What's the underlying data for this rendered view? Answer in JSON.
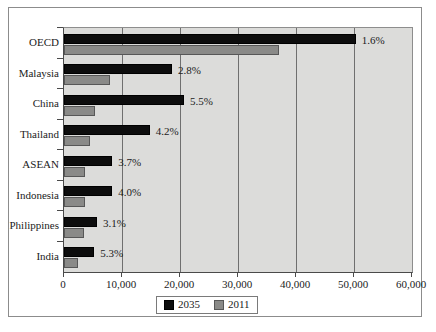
{
  "chart_data": {
    "type": "bar",
    "orientation": "horizontal",
    "title": "",
    "subtitle": "",
    "xlabel": "",
    "ylabel": "",
    "xlim": [
      0,
      60000
    ],
    "xticks": [
      0,
      10000,
      20000,
      30000,
      40000,
      50000,
      60000
    ],
    "xtick_labels": [
      "0",
      "10,000",
      "20,000",
      "30,000",
      "40,000",
      "50,000",
      "60,000"
    ],
    "grid": true,
    "grid_axis": "x",
    "legend_position": "bottom",
    "categories": [
      "OECD",
      "Malaysia",
      "China",
      "Thailand",
      "ASEAN",
      "Indonesia",
      "Philippines",
      "India"
    ],
    "series": [
      {
        "name": "2035",
        "color": "#0d0d0d",
        "values": [
          50300,
          18600,
          20700,
          14800,
          8300,
          8300,
          5700,
          5200
        ]
      },
      {
        "name": "2011",
        "color": "#8a8a88",
        "values": [
          37000,
          8000,
          5300,
          4500,
          3600,
          3600,
          3500,
          2400
        ]
      }
    ],
    "annotations": [
      {
        "category": "OECD",
        "text": "1.6%"
      },
      {
        "category": "Malaysia",
        "text": "2.8%"
      },
      {
        "category": "China",
        "text": "5.5%"
      },
      {
        "category": "Thailand",
        "text": "4.2%"
      },
      {
        "category": "ASEAN",
        "text": "3.7%"
      },
      {
        "category": "Indonesia",
        "text": "4.0%"
      },
      {
        "category": "Philippines",
        "text": "3.1%"
      },
      {
        "category": "India",
        "text": "5.3%"
      }
    ],
    "plot_background": "#dcdcda",
    "figure_background": "#ffffff"
  },
  "legend": {
    "items": [
      {
        "label": "2035",
        "color": "#0d0d0d"
      },
      {
        "label": "2011",
        "color": "#8a8a88"
      }
    ]
  }
}
